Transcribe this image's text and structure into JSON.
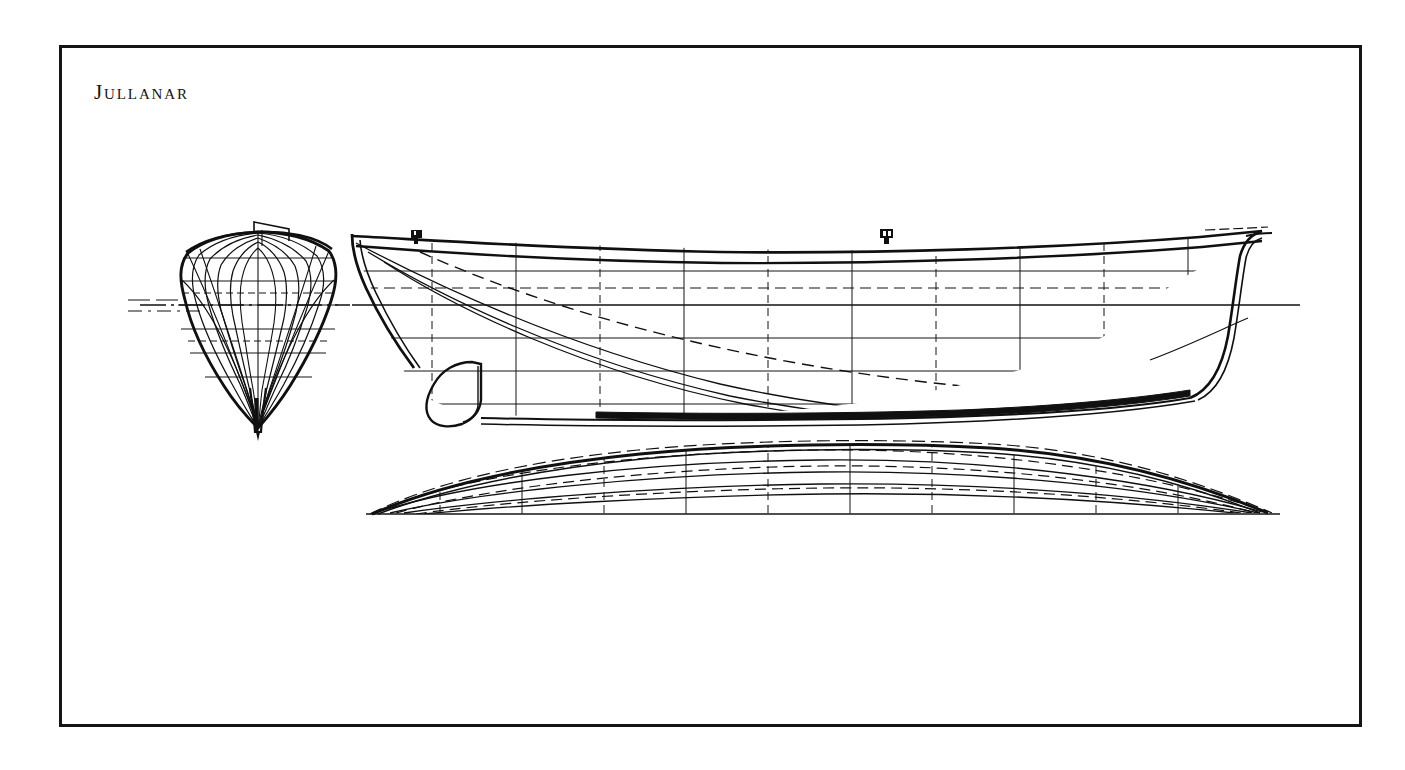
{
  "plate": {
    "title": "Jullanar",
    "background_color": "#ffffff",
    "ink_color": "#101010",
    "border": {
      "color": "#151515",
      "thickness_px": 3,
      "x": 59,
      "y": 45,
      "width": 1303,
      "height": 682
    },
    "drawing_type": "naval-architecture-lines-plan",
    "views": [
      {
        "name": "body-plan",
        "label": "Body plan (sections, bow view)",
        "center_x": 258,
        "deck_y": 237,
        "waterline_y": 305,
        "keel_tip_y": 428,
        "half_beam_px": 72,
        "station_count": 9,
        "waterline_count": 6
      },
      {
        "name": "sheer-plan",
        "label": "Sheer plan (profile)",
        "bow_x": 352,
        "stern_x": 1262,
        "deck_y_bow": 238,
        "deck_y_mid": 252,
        "deck_y_stern": 232,
        "waterline_y": 305,
        "keel_y": 418,
        "station_count": 11,
        "buttock_count": 4,
        "waterline_count": 5
      },
      {
        "name": "half-breadth-plan",
        "label": "Half-breadth plan (waterlines)",
        "bow_x": 372,
        "stern_x": 1268,
        "centerline_y": 514,
        "max_halfbreadth_px": 62,
        "station_count": 11,
        "waterline_count": 5
      }
    ],
    "fittings": [
      {
        "name": "bow-bitt",
        "x": 416,
        "y": 237
      },
      {
        "name": "mast-partner-bitt",
        "x": 886,
        "y": 236
      }
    ],
    "features": [
      "raised stem head",
      "long hollow entry",
      "deep narrow fin keel with pointed bulb",
      "cutaway rounded forefoot",
      "lead ballast shoe",
      "counter stern with overhang",
      "rudder post",
      "load waterline extension centerline"
    ],
    "line_styles": {
      "hull_outline": "solid-heavy",
      "stations": "alternating solid and dashed",
      "waterlines": "solid-light",
      "buttocks": "solid-light-curved",
      "diagonals": "dashed",
      "centerline": "dash-dot"
    }
  }
}
